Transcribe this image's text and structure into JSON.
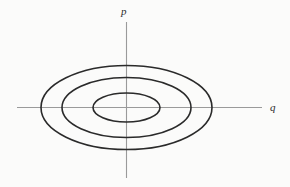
{
  "figure": {
    "title": "",
    "background_color": "#fbfbfa",
    "axis_color": "#9a9a9a",
    "curve_color": "#2a2a2a"
  },
  "labels": {
    "vertical_axis": "p",
    "horizontal_axis": "q"
  },
  "chart_data": {
    "type": "line",
    "title": "",
    "subtitle": "",
    "xlabel": "q",
    "ylabel": "p",
    "grid": false,
    "legend": "none",
    "origin": {
      "x": 126.5,
      "y": 107.5
    },
    "xlim": [
      -110,
      136
    ],
    "ylim": [
      -71,
      86
    ],
    "axes": [
      {
        "name": "q-axis",
        "orientation": "horizontal",
        "x_start": 17,
        "x_end": 262,
        "y": 107.5,
        "arrow": false
      },
      {
        "name": "p-axis",
        "orientation": "vertical",
        "y_start": 22,
        "y_end": 178,
        "x": 126.5,
        "arrow": false
      }
    ],
    "series": [
      {
        "name": "orbit-outer",
        "type": "ellipse",
        "semi_axis_q": 85.5,
        "semi_axis_p": 42.0,
        "left": 41,
        "right": 212,
        "top": 66,
        "bottom": 149,
        "stroke_width": 1.6
      },
      {
        "name": "orbit-middle",
        "type": "ellipse",
        "semi_axis_q": 64.5,
        "semi_axis_p": 30.0,
        "left": 62,
        "right": 191,
        "top": 77,
        "bottom": 137,
        "stroke_width": 1.6
      },
      {
        "name": "orbit-inner",
        "type": "ellipse",
        "semi_axis_q": 33.5,
        "semi_axis_p": 14.5,
        "left": 93,
        "right": 160,
        "top": 93,
        "bottom": 122,
        "stroke_width": 1.6
      }
    ]
  }
}
